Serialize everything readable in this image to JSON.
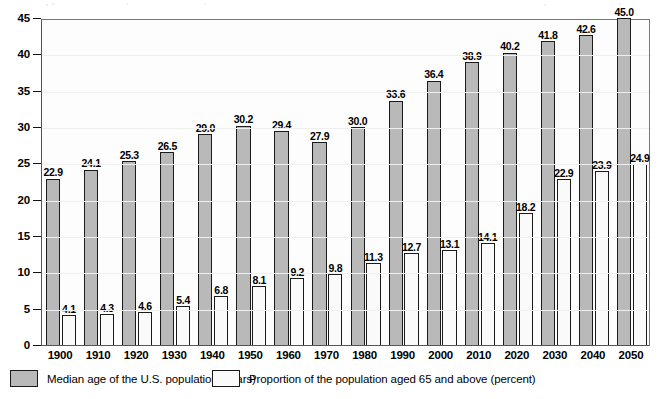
{
  "chart_data": {
    "type": "bar",
    "title": "",
    "xlabel": "",
    "ylabel": "",
    "ylim": [
      0,
      45
    ],
    "ytick_step": 5,
    "grid": false,
    "legend_position": "bottom-left",
    "categories": [
      "1900",
      "1910",
      "1920",
      "1930",
      "1940",
      "1950",
      "1960",
      "1970",
      "1980",
      "1990",
      "2000",
      "2010",
      "2020",
      "2030",
      "2040",
      "2050"
    ],
    "yticks": [
      "0",
      "5",
      "10",
      "15",
      "20",
      "25",
      "30",
      "35",
      "40",
      "45"
    ],
    "series": [
      {
        "name": "Median age of the U.S. population (years)",
        "key": "median",
        "color": "#b9b9b9",
        "values": [
          22.9,
          24.1,
          25.3,
          26.5,
          29.0,
          30.2,
          29.4,
          27.9,
          30.0,
          33.6,
          36.4,
          38.9,
          40.2,
          41.8,
          42.6,
          45.0
        ],
        "labels": [
          "22.9",
          "24.1",
          "25.3",
          "26.5",
          "29.0",
          "30.2",
          "29.4",
          "27.9",
          "30.0",
          "33.6",
          "36.4",
          "38.9",
          "40.2",
          "41.8",
          "42.6",
          "45.0"
        ]
      },
      {
        "name": "Proportion of the population aged 65 and above (percent)",
        "key": "prop",
        "color": "#fafafa",
        "values": [
          4.1,
          4.3,
          4.6,
          5.4,
          6.8,
          8.1,
          9.2,
          9.8,
          11.3,
          12.7,
          13.1,
          14.1,
          18.2,
          22.9,
          23.9,
          24.9
        ],
        "labels": [
          "4.1",
          "4.3",
          "4.6",
          "5.4",
          "6.8",
          "8.1",
          "9.2",
          "9.8",
          "11.3",
          "12.7",
          "13.1",
          "14.1",
          "18.2",
          "22.9",
          "23.9",
          "24.9"
        ]
      }
    ]
  },
  "legend": {
    "entries": [
      {
        "label": "Median age of the U.S. population (years)",
        "swatch": "median"
      },
      {
        "label": "Proportion of the population aged 65 and above (percent)",
        "swatch": "prop"
      }
    ]
  }
}
